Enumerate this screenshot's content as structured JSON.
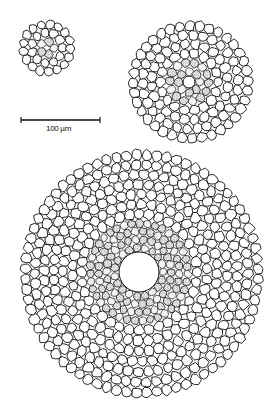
{
  "figure": {
    "scale_bar": {
      "label": "100 µm",
      "x1": 21,
      "x2": 100,
      "y": 120
    },
    "sections": [
      {
        "id": "small",
        "cx": 47,
        "cy": 48,
        "rx": 28,
        "ry": 28,
        "stele_r": 11,
        "hole_r": 2,
        "cell_rows": 2
      },
      {
        "id": "medium",
        "cx": 191,
        "cy": 82,
        "rx": 62,
        "ry": 61,
        "stele_cx": 189,
        "stele_cy": 82,
        "stele_r": 24,
        "hole_r": 6,
        "cell_rows": 4
      },
      {
        "id": "large",
        "cx": 142,
        "cy": 274,
        "rx": 121,
        "ry": 124,
        "stele_cx": 139,
        "stele_cy": 272,
        "stele_r": 53,
        "hole_r": 20,
        "cell_rows": 7
      }
    ]
  },
  "colors": {
    "line": "#111111",
    "background": "#ffffff",
    "stipple": "#9a9a9a"
  }
}
